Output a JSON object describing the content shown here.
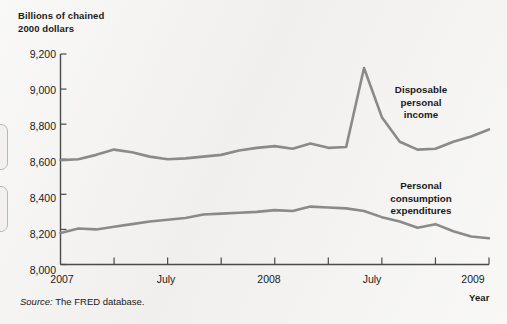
{
  "chart_data": {
    "type": "line",
    "title": "",
    "ylabel": "Billions of chained\n2000 dollars",
    "xlabel": "Year",
    "ylim": [
      8000,
      9200
    ],
    "yticks": [
      "8,000",
      "8,200",
      "8,400",
      "8,600",
      "8,800",
      "9,000",
      "9,200"
    ],
    "ytick_values": [
      8000,
      8200,
      8400,
      8600,
      8800,
      9000,
      9200
    ],
    "xticks": [
      "2007",
      "July",
      "2008",
      "July",
      "2009"
    ],
    "xtick_positions": [
      0,
      6,
      12,
      18,
      24
    ],
    "minor_xticks": [
      3,
      9,
      15,
      21
    ],
    "grid": false,
    "legend_position": "inline-annotations",
    "x": [
      "2007-01",
      "2007-02",
      "2007-03",
      "2007-04",
      "2007-05",
      "2007-06",
      "2007-07",
      "2007-08",
      "2007-09",
      "2007-10",
      "2007-11",
      "2007-12",
      "2008-01",
      "2008-02",
      "2008-03",
      "2008-04",
      "2008-05",
      "2008-06",
      "2008-07",
      "2008-08",
      "2008-09",
      "2008-10",
      "2008-11"
    ],
    "series": [
      {
        "name": "Disposable personal income",
        "color": "#8a8a8a",
        "values": [
          8595,
          8600,
          8625,
          8655,
          8640,
          8615,
          8600,
          8605,
          8615,
          8625,
          8650,
          8665,
          8675,
          8660,
          8690,
          8665,
          8670,
          9120,
          8840,
          8700,
          8655,
          8660,
          8700
        ],
        "extra_values": [
          8730,
          8770
        ]
      },
      {
        "name": "Personal consumption expenditures",
        "color": "#8a8a8a",
        "values": [
          8180,
          8205,
          8200,
          8215,
          8230,
          8245,
          8255,
          8265,
          8285,
          8290,
          8295,
          8300,
          8310,
          8305,
          8330,
          8325,
          8320,
          8305,
          8270,
          8245,
          8210,
          8230,
          8190
        ],
        "extra_values": [
          8160,
          8150
        ]
      }
    ],
    "annotations": [
      {
        "text": "Disposable\npersonal\nincome",
        "x": 421,
        "y": 103
      },
      {
        "text": "Personal\nconsumption\nexpenditures",
        "x": 421,
        "y": 199
      }
    ]
  },
  "axis": {
    "y_title": "Billions of chained\n2000 dollars",
    "x_title": "Year",
    "y_labels": [
      "9,200",
      "9,000",
      "8,800",
      "8,600",
      "8,400",
      "8,200",
      "8,000"
    ],
    "x_labels": [
      "2007",
      "July",
      "2008",
      "July",
      "2009"
    ]
  },
  "annotations": {
    "disposable_income": "Disposable\npersonal\nincome",
    "consumption": "Personal\nconsumption\nexpenditures"
  },
  "source": {
    "prefix": "Source:",
    "text": " The FRED database."
  },
  "colors": {
    "line": "#8a8a8a",
    "axis": "#4a4a4a",
    "background": "#f2f1ef",
    "text": "#1a1a1a"
  }
}
